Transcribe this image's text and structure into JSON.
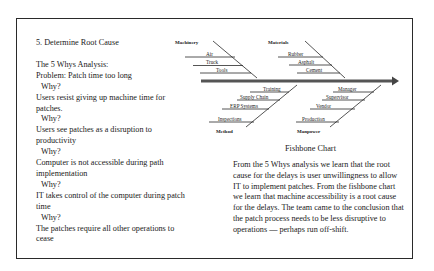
{
  "left_panel": {
    "heading": "5. Determine Root Cause",
    "analysis_title": "The 5 Whys Analysis:",
    "lines": [
      {
        "type": "text",
        "text": "Problem: Patch time too long"
      },
      {
        "type": "why",
        "text": "Why?"
      },
      {
        "type": "text",
        "text": "Users resist giving up machine time for patches."
      },
      {
        "type": "why",
        "text": "Why?"
      },
      {
        "type": "text",
        "text": "Users see patches as a disruption to productivity"
      },
      {
        "type": "why",
        "text": "Why?"
      },
      {
        "type": "text",
        "text": "Computer is not accessible during path implementation"
      },
      {
        "type": "why",
        "text": "Why?"
      },
      {
        "type": "text",
        "text": "IT takes control of the computer during patch time"
      },
      {
        "type": "why",
        "text": "Why?"
      },
      {
        "type": "text",
        "text": "The patches require all other operations to cease"
      }
    ]
  },
  "fishbone": {
    "caption": "Fishbone Chart",
    "categories": {
      "machinery": {
        "label": "Machinery",
        "causes": [
          "Air",
          "Truck",
          "Tools"
        ]
      },
      "materials": {
        "label": "Materials",
        "causes": [
          "Rubber",
          "Asphalt",
          "Cement"
        ]
      },
      "method": {
        "label": "Method",
        "causes": [
          "Training",
          "Supply Chain",
          "ERP Systems",
          "Inspections"
        ]
      },
      "manpower": {
        "label": "Manpower",
        "causes": [
          "Manager",
          "Supervisor",
          "Vendor",
          "Production"
        ]
      }
    },
    "colors": {
      "line": "#2a2a2a",
      "spine": "#555555"
    }
  },
  "conclusion": "From the 5 Whys analysis we learn that the root cause for the delays is user unwillingness to allow IT to implement patches. From the fishbone chart we learn that machine accessibility is a root cause for the delays. The team came to the conclusion that the patch process needs to be less disruptive to operations — perhaps run off-shift."
}
